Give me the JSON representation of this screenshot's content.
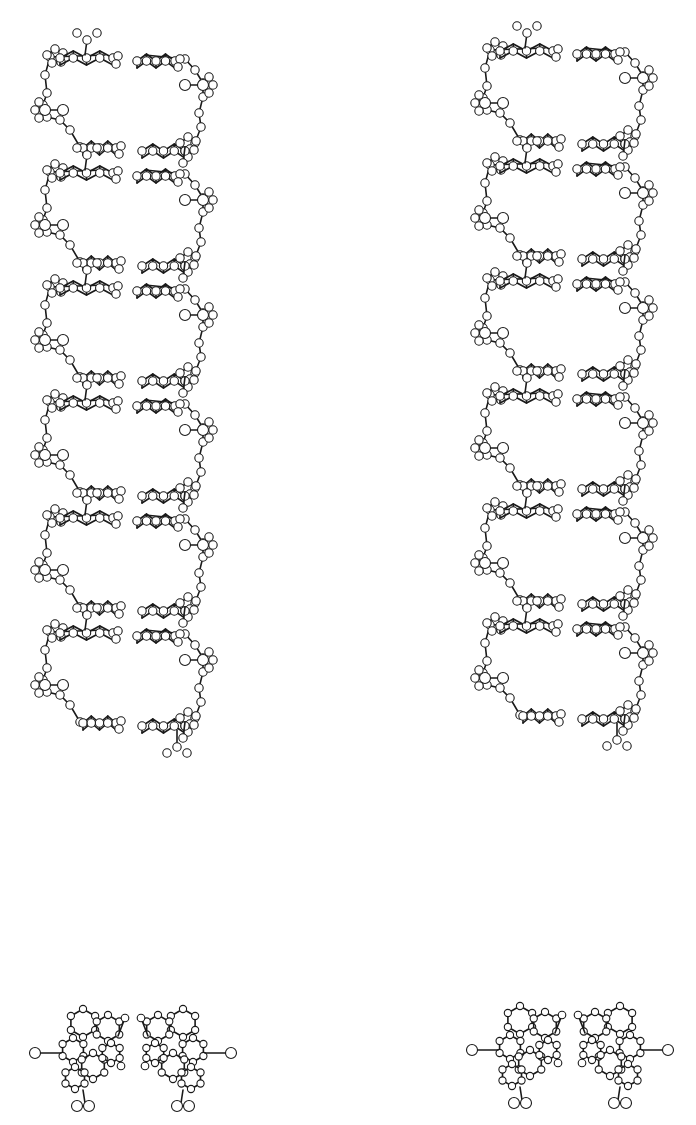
{
  "figure": {
    "type": "stereo-pair molecular model",
    "background": "#ffffff",
    "ink": "#1a1a1a"
  },
  "side_views": [
    {
      "name": "left-helix-side-view",
      "x": 25,
      "y_top": 35,
      "width": 200,
      "period": 115,
      "turns": 5.6
    },
    {
      "name": "right-helix-side-view",
      "x": 465,
      "y_top": 28,
      "width": 200,
      "period": 115,
      "turns": 5.6
    }
  ],
  "end_views": [
    {
      "name": "left-helix-end-view",
      "cx": 133,
      "cy": 1048
    },
    {
      "name": "right-helix-end-view",
      "cx": 570,
      "cy": 1045
    }
  ],
  "layout": {
    "strand_gap": 12,
    "base_pair_rows_per_period": 2,
    "atom_radius": 4.2,
    "atom_radius_large": 5.5
  }
}
